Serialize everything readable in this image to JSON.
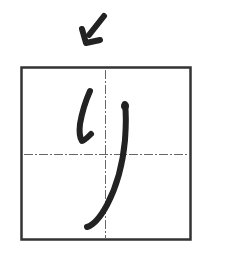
{
  "diagram": {
    "character": "り",
    "stroke_count": 2,
    "colors": {
      "ink": "#222222",
      "frame": "#333333",
      "guide": "#555555",
      "background": "#ffffff"
    },
    "arrow": {
      "icon": "arrow-down-left-icon",
      "direction": "down-left"
    },
    "frame": {
      "guides": "dashed center cross"
    }
  }
}
